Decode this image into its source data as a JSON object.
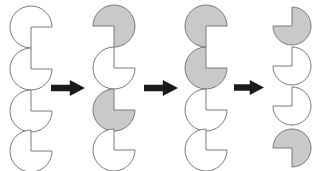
{
  "figure": {
    "type": "shape-sequence-diagram",
    "background_color": "#ffffff",
    "width": 319,
    "height": 171,
    "outline_color": "#7a7a7a",
    "fill_white": "#ffffff",
    "fill_gray": "#c9c9c9",
    "arrow_color": "#1a1a1a"
  },
  "columns": [
    {
      "name": "column-1",
      "x": 8,
      "shapes": [
        {
          "name": "shape-1-1",
          "y": 4,
          "radius": 21,
          "fill": "#ffffff",
          "notch": "bottom-right",
          "notch_label": "wedge-bottom-right"
        },
        {
          "name": "shape-1-2",
          "y": 46,
          "radius": 21,
          "fill": "#ffffff",
          "notch": "top-right",
          "notch_label": "wedge-top-right"
        },
        {
          "name": "shape-1-3",
          "y": 88,
          "radius": 21,
          "fill": "#ffffff",
          "notch": "top-right",
          "notch_label": "wedge-top-right"
        },
        {
          "name": "shape-1-4",
          "y": 128,
          "radius": 21,
          "fill": "#ffffff",
          "notch": "top-right",
          "notch_label": "wedge-top-right"
        }
      ]
    },
    {
      "name": "column-2",
      "x": 91,
      "shapes": [
        {
          "name": "shape-2-1",
          "y": 3,
          "radius": 21,
          "fill": "#c9c9c9",
          "notch": "bottom-left",
          "notch_label": "wedge-bottom-left"
        },
        {
          "name": "shape-2-2",
          "y": 45,
          "radius": 21,
          "fill": "#ffffff",
          "notch": "top-right",
          "notch_label": "wedge-top-right"
        },
        {
          "name": "shape-2-3",
          "y": 87,
          "radius": 21,
          "fill": "#c9c9c9",
          "notch": "top-right",
          "notch_label": "wedge-top-right"
        },
        {
          "name": "shape-2-4",
          "y": 127,
          "radius": 21,
          "fill": "#ffffff",
          "notch": "top-right",
          "notch_label": "wedge-top-right"
        }
      ]
    },
    {
      "name": "column-3",
      "x": 183,
      "shapes": [
        {
          "name": "shape-3-1",
          "y": 3,
          "radius": 21,
          "fill": "#c9c9c9",
          "notch": "bottom-right",
          "notch_label": "wedge-bottom-right"
        },
        {
          "name": "shape-3-2",
          "y": 45,
          "radius": 21,
          "fill": "#c9c9c9",
          "notch": "top-right",
          "notch_label": "wedge-top-right"
        },
        {
          "name": "shape-3-3",
          "y": 87,
          "radius": 21,
          "fill": "#ffffff",
          "notch": "top-right",
          "notch_label": "wedge-top-right"
        },
        {
          "name": "shape-3-4",
          "y": 127,
          "radius": 21,
          "fill": "#ffffff",
          "notch": "top-right",
          "notch_label": "wedge-top-right"
        }
      ]
    },
    {
      "name": "column-4",
      "x": 271,
      "shapes": [
        {
          "name": "shape-4-1",
          "y": 5,
          "radius": 19,
          "fill": "#c9c9c9",
          "notch": "top-left",
          "notch_label": "wedge-top-left"
        },
        {
          "name": "shape-4-2",
          "y": 45,
          "radius": 19,
          "fill": "#ffffff",
          "notch": "top-left",
          "notch_label": "wedge-top-left"
        },
        {
          "name": "shape-4-3",
          "y": 85,
          "radius": 19,
          "fill": "#ffffff",
          "notch": "top-left",
          "notch_label": "wedge-top-left"
        },
        {
          "name": "shape-4-4",
          "y": 127,
          "radius": 19,
          "fill": "#c9c9c9",
          "notch": "bottom-left",
          "notch_label": "wedge-bottom-left"
        }
      ]
    }
  ],
  "arrows": [
    {
      "name": "arrow-1",
      "x": 51,
      "y": 80,
      "width": 34,
      "height": 16,
      "direction": "right",
      "icon": "arrow-right-icon"
    },
    {
      "name": "arrow-2",
      "x": 144,
      "y": 80,
      "width": 34,
      "height": 16,
      "direction": "right",
      "icon": "arrow-right-icon"
    },
    {
      "name": "arrow-3",
      "x": 234,
      "y": 80,
      "width": 30,
      "height": 15,
      "direction": "right",
      "icon": "arrow-right-icon"
    }
  ]
}
